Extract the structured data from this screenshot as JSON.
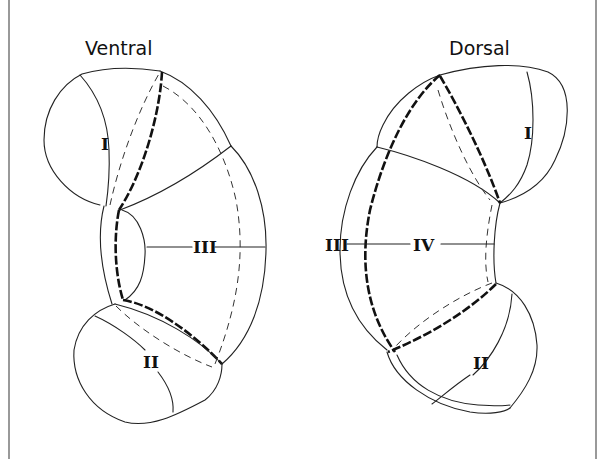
{
  "figure": {
    "views": [
      {
        "id": "ventral",
        "title": "Ventral",
        "regions": [
          "I",
          "II",
          "III"
        ]
      },
      {
        "id": "dorsal",
        "title": "Dorsal",
        "regions": [
          "I",
          "II",
          "III",
          "IV"
        ]
      }
    ],
    "labels": {
      "ventral_title": "Ventral",
      "ventral_I": "I",
      "ventral_II": "II",
      "ventral_III": "III",
      "dorsal_title": "Dorsal",
      "dorsal_I": "I",
      "dorsal_II": "II",
      "dorsal_III": "III",
      "dorsal_IV": "IV"
    },
    "line_legend": {
      "solid_thin": "outline / boundary",
      "dashed_thin": "hidden boundary",
      "dashed_bold": "highlighted boundary"
    },
    "colors": {
      "background": "#ffffff",
      "ink": "#111111"
    }
  }
}
